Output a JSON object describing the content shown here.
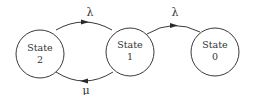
{
  "diagram": {
    "type": "state-transition",
    "states": [
      {
        "id": "state-2",
        "line1": "State",
        "line2": "2",
        "cx": 40,
        "cy": 54,
        "r": 24
      },
      {
        "id": "state-1",
        "line1": "State",
        "line2": "1",
        "cx": 130,
        "cy": 52,
        "r": 24
      },
      {
        "id": "state-0",
        "line1": "State",
        "line2": "0",
        "cx": 215,
        "cy": 52,
        "r": 24
      }
    ],
    "transitions": [
      {
        "from": "state-2",
        "to": "state-1",
        "label": "λ",
        "position": "top"
      },
      {
        "from": "state-1",
        "to": "state-2",
        "label": "μ",
        "position": "bottom"
      },
      {
        "from": "state-1",
        "to": "state-0",
        "label": "λ",
        "position": "top"
      }
    ],
    "colors": {
      "stroke": "#3a3a3a",
      "text": "#333333",
      "background": "#ffffff"
    }
  }
}
